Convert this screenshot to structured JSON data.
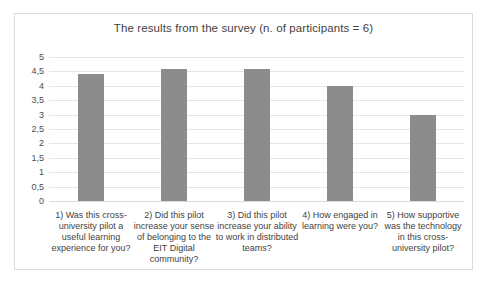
{
  "chart_data": {
    "type": "bar",
    "title": "The results from the survey (n. of participants = 6)",
    "categories": [
      "1) Was this cross-university pilot a useful learning experience for you?",
      "2) Did this pilot increase your sense of belonging to the EIT Digital community?",
      "3) Did this pilot increase your ability to work in distributed teams?",
      "4) How engaged in learning were you?",
      "5) How supportive was the technology in this cross-university pilot?"
    ],
    "values": [
      4.4,
      4.6,
      4.6,
      4.0,
      3.0
    ],
    "ylim": [
      0,
      5
    ],
    "ytick_step": 0.5,
    "ytick_labels": [
      "0",
      "0,5",
      "1",
      "1,5",
      "2",
      "2,5",
      "3",
      "3,5",
      "4",
      "4,5",
      "5"
    ],
    "xlabel": "",
    "ylabel": "",
    "grid": true,
    "legend": false,
    "colors": {
      "bar": "#8c8c8c",
      "gridline": "#e6e6e6",
      "zero_line": "#dadada",
      "frame_border": "#dcdcdc",
      "title_text": "#3f3f3f",
      "axis_text": "#4d4d4d",
      "background": "#ffffff"
    }
  }
}
